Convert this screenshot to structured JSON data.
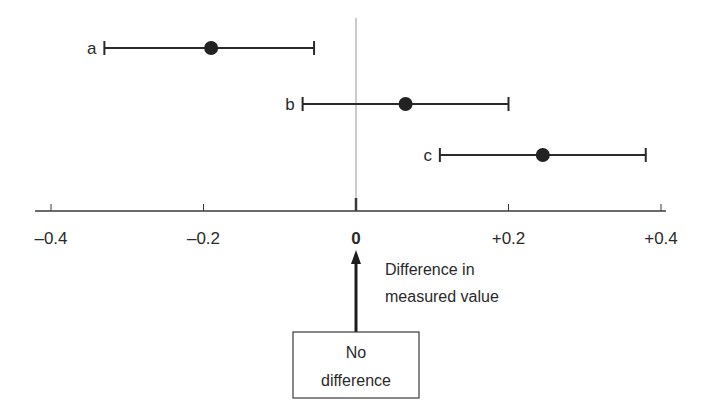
{
  "chart_data": {
    "type": "forest",
    "title": "",
    "xlabel": "Difference in measured value",
    "ylabel": "",
    "xlim": [
      -0.4,
      0.4
    ],
    "x_ticks": [
      -0.4,
      -0.2,
      0,
      0.2,
      0.4
    ],
    "x_tick_labels": [
      "–0.4",
      "–0.2",
      "0",
      "+0.2",
      "+0.4"
    ],
    "reference_line": 0,
    "grid": false,
    "series": [
      {
        "name": "a",
        "estimate": -0.19,
        "ci_low": -0.33,
        "ci_high": -0.055
      },
      {
        "name": "b",
        "estimate": 0.065,
        "ci_low": -0.07,
        "ci_high": 0.2
      },
      {
        "name": "c",
        "estimate": 0.245,
        "ci_low": 0.11,
        "ci_high": 0.38
      }
    ],
    "annotations": [
      {
        "text": "No difference",
        "points_to": 0
      }
    ]
  },
  "labels": {
    "axis_title_line1": "Difference in",
    "axis_title_line2": "measured value",
    "box_line1": "No",
    "box_line2": "difference"
  }
}
